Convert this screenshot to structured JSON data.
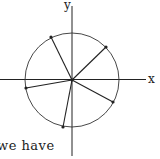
{
  "diagram": {
    "axes": {
      "x_label": "x",
      "y_label": "y"
    },
    "circle": {
      "cx": 72,
      "cy": 80,
      "r": 47
    },
    "center": {
      "x": 72,
      "y": 80
    },
    "radial_points": [
      {
        "x": 51,
        "y": 37
      },
      {
        "x": 106,
        "y": 47
      },
      {
        "x": 113,
        "y": 102
      },
      {
        "x": 63,
        "y": 127
      },
      {
        "x": 26,
        "y": 88
      }
    ],
    "colors": {
      "stroke": "#222222",
      "background": "#ffffff"
    }
  },
  "text": {
    "caption_fragment": "we have"
  }
}
